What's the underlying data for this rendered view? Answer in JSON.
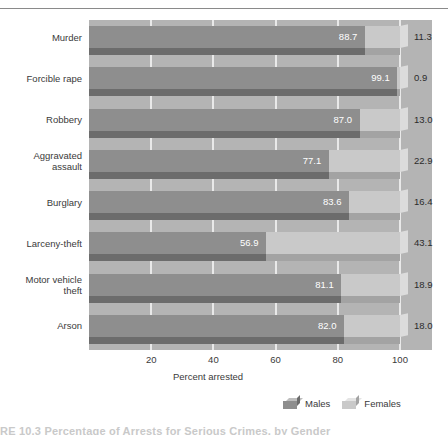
{
  "chart_data": {
    "type": "bar",
    "orientation": "horizontal",
    "stacked": true,
    "title": "",
    "xlabel": "Percent arrested",
    "ylabel": "",
    "xlim": [
      0,
      100
    ],
    "xticks": [
      20,
      40,
      60,
      80,
      100
    ],
    "grid": true,
    "legend_position": "bottom-right",
    "categories": [
      "Murder",
      "Forcible rape",
      "Robbery",
      "Aggravated assault",
      "Burglary",
      "Larceny-theft",
      "Motor vehicle theft",
      "Arson"
    ],
    "series": [
      {
        "name": "Males",
        "color": "#8e8e8e",
        "values": [
          88.7,
          99.1,
          87.0,
          77.1,
          83.6,
          56.9,
          81.1,
          82.0
        ]
      },
      {
        "name": "Females",
        "color": "#c9c9c9",
        "values": [
          11.3,
          0.9,
          13.0,
          22.9,
          16.4,
          43.1,
          18.9,
          18.0
        ]
      }
    ]
  },
  "axis": {
    "xlabel": "Percent arrested",
    "ticks": [
      "20",
      "40",
      "60",
      "80",
      "100"
    ]
  },
  "legend": {
    "items": [
      {
        "label": "Males",
        "color": "#8e8e8e"
      },
      {
        "label": "Females",
        "color": "#c9c9c9"
      }
    ]
  },
  "category_labels": [
    {
      "line1": "Murder",
      "line2": ""
    },
    {
      "line1": "Forcible rape",
      "line2": ""
    },
    {
      "line1": "Robbery",
      "line2": ""
    },
    {
      "line1": "Aggravated",
      "line2": "assault"
    },
    {
      "line1": "Burglary",
      "line2": ""
    },
    {
      "line1": "Larceny-theft",
      "line2": ""
    },
    {
      "line1": "Motor vehicle",
      "line2": "theft"
    },
    {
      "line1": "Arson",
      "line2": ""
    }
  ],
  "value_labels": {
    "male": [
      "88.7",
      "99.1",
      "87.0",
      "77.1",
      "83.6",
      "56.9",
      "81.1",
      "82.0"
    ],
    "female": [
      "11.3",
      "0.9",
      "13.0",
      "22.9",
      "16.4",
      "43.1",
      "18.9",
      "18.0"
    ]
  },
  "caption": "RE 10.3  Percentage of Arrests for Serious Crimes, by Gender"
}
